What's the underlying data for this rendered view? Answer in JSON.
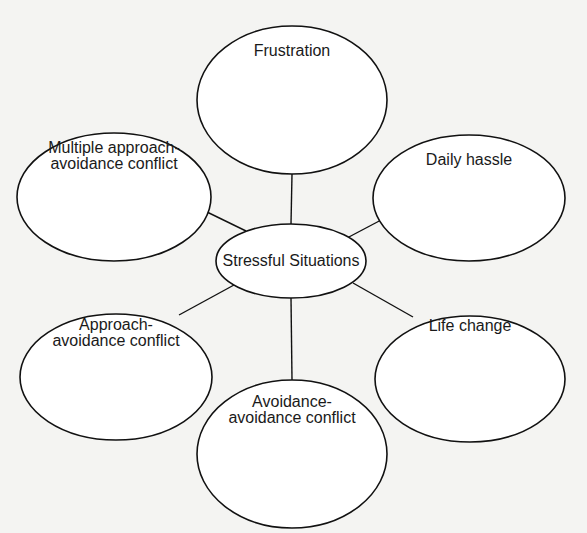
{
  "diagram": {
    "center": {
      "label": "Stressful Situations",
      "cx": 291,
      "cy": 261,
      "rx": 75,
      "ry": 37
    },
    "nodes": [
      {
        "id": "frustration",
        "label": "Frustration",
        "cx": 292,
        "cy": 100,
        "rx": 95,
        "ry": 74,
        "label_y": 43,
        "content": ""
      },
      {
        "id": "daily-hassle",
        "label": "Daily hassle",
        "cx": 469,
        "cy": 198,
        "rx": 96,
        "ry": 63,
        "label_y": 152,
        "content": ""
      },
      {
        "id": "life-change",
        "label": "Life change",
        "cx": 470,
        "cy": 379,
        "rx": 95,
        "ry": 63,
        "label_y": 318,
        "content": ""
      },
      {
        "id": "avoidance-avoidance",
        "label": "Avoidance-\navoidance conflict",
        "cx": 292,
        "cy": 454,
        "rx": 95,
        "ry": 74,
        "label_y": 394,
        "content": ""
      },
      {
        "id": "approach-avoidance",
        "label": "Approach-\navoidance conflict",
        "cx": 116,
        "cy": 377,
        "rx": 96,
        "ry": 63,
        "label_y": 317,
        "content": ""
      },
      {
        "id": "multiple-approach-avoidance",
        "label": "Multiple approach-\navoidance conflict",
        "cx": 114,
        "cy": 197,
        "rx": 97,
        "ry": 64,
        "label_y": 140,
        "content": ""
      }
    ],
    "edges": [
      {
        "from": "center",
        "to": "frustration",
        "x1": 291,
        "y1": 224,
        "x2": 292,
        "y2": 174
      },
      {
        "from": "center",
        "to": "daily-hassle",
        "x1": 347,
        "y1": 238,
        "x2": 383,
        "y2": 219
      },
      {
        "from": "center",
        "to": "life-change",
        "x1": 353,
        "y1": 283,
        "x2": 413,
        "y2": 317
      },
      {
        "from": "center",
        "to": "avoidance-avoidance",
        "x1": 291,
        "y1": 298,
        "x2": 292,
        "y2": 380
      },
      {
        "from": "center",
        "to": "approach-avoidance",
        "x1": 234,
        "y1": 285,
        "x2": 179,
        "y2": 315
      },
      {
        "from": "center",
        "to": "multiple-approach-avoidance",
        "x1": 246,
        "y1": 231,
        "x2": 207,
        "y2": 212
      }
    ],
    "colors": {
      "stroke": "#111111",
      "background": "#f4f4f2",
      "fill": "#ffffff",
      "text": "#1a1a1a"
    }
  }
}
